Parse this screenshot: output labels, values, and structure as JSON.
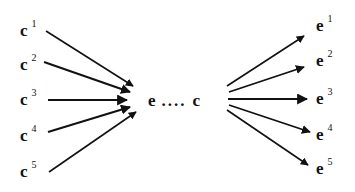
{
  "diagram": {
    "inputs": [
      {
        "base": "c",
        "sup": "1",
        "x": 20,
        "y": 22
      },
      {
        "base": "c",
        "sup": "2",
        "x": 20,
        "y": 56
      },
      {
        "base": "c",
        "sup": "3",
        "x": 20,
        "y": 91
      },
      {
        "base": "c",
        "sup": "4",
        "x": 20,
        "y": 127
      },
      {
        "base": "c",
        "sup": "5",
        "x": 20,
        "y": 163
      }
    ],
    "center": {
      "left": "e",
      "dots": "....",
      "right": "c"
    },
    "outputs": [
      {
        "base": "e",
        "sup": "1",
        "x": 316,
        "y": 17
      },
      {
        "base": "e",
        "sup": "2",
        "x": 316,
        "y": 52
      },
      {
        "base": "e",
        "sup": "3",
        "x": 316,
        "y": 90
      },
      {
        "base": "e",
        "sup": "4",
        "x": 316,
        "y": 126
      },
      {
        "base": "e",
        "sup": "5",
        "x": 316,
        "y": 160
      }
    ],
    "arrow_color": "#111111"
  }
}
